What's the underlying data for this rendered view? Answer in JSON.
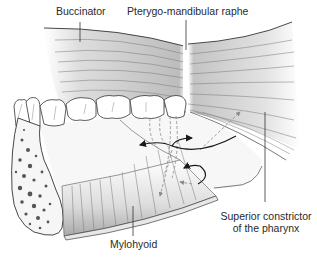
{
  "figure": {
    "labels": {
      "buccinator": "Buccinator",
      "raphe": "Pterygo-mandibular raphe",
      "superior_constrictor_line1": "Superior constrictor",
      "superior_constrictor_line2": "of the pharynx",
      "mylohyoid": "Mylohyoid"
    },
    "colors": {
      "outline": "#3a3a3a",
      "muscle_shade": "#bdbdbd",
      "bone_spots": "#555555",
      "arrow": "#1a1a1a",
      "dashed": "#8a8a8a"
    }
  }
}
